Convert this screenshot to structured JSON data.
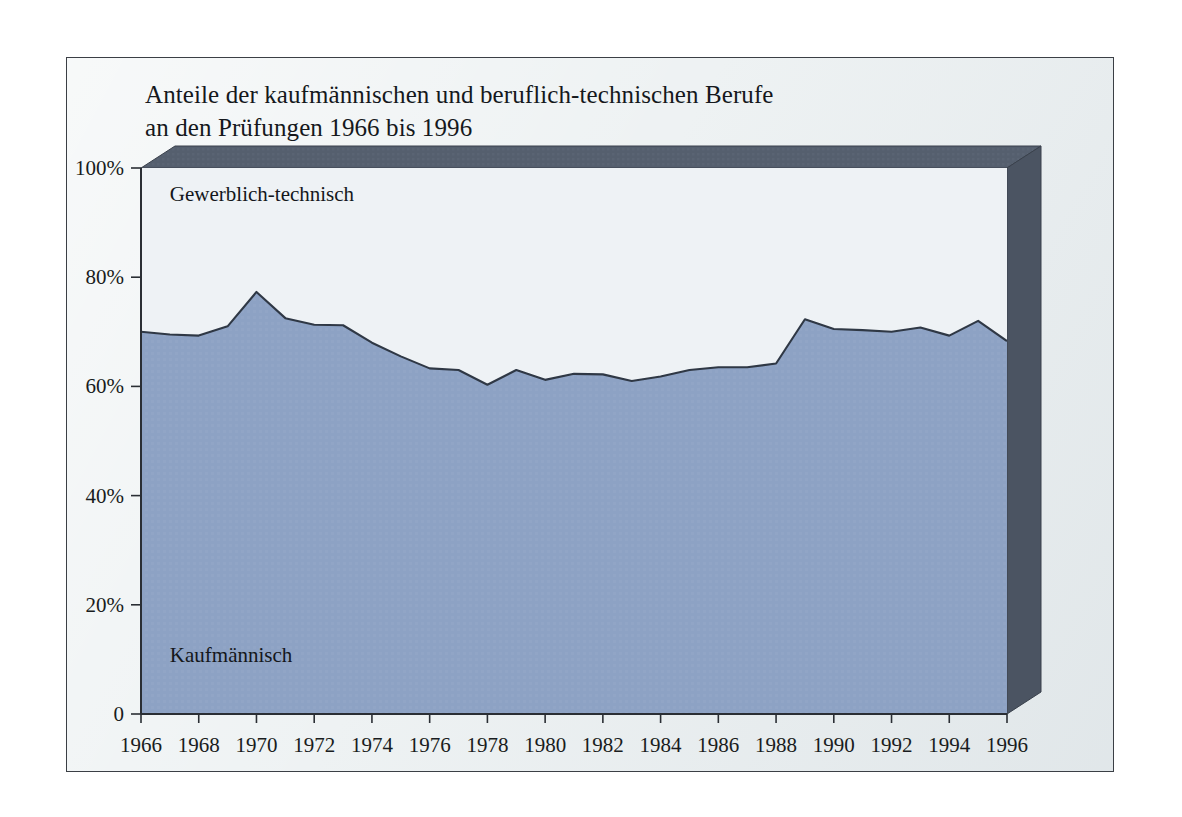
{
  "page": {
    "background_color": "#ffffff",
    "card_background_color": "#eef2f3",
    "card_border_color": "#3b3f45"
  },
  "title": {
    "line1": "Anteile der kaufmännischen und beruflich-technischen Berufe",
    "line2": "an den Prüfungen 1966 bis 1996"
  },
  "chart_data": {
    "type": "area",
    "title": "Anteile der kaufmännischen und beruflich-technischen Berufe an den Prüfungen 1966 bis 1996",
    "xlabel": "",
    "ylabel": "",
    "ylim": [
      0,
      100
    ],
    "xlim": [
      1966,
      1996
    ],
    "grid": false,
    "legend_position": "inline-annotation",
    "stacked": true,
    "y_tick_labels": [
      "0",
      "20%",
      "40%",
      "60%",
      "80%",
      "100%"
    ],
    "y_tick_values": [
      0,
      20,
      40,
      60,
      80,
      100
    ],
    "x_tick_labels": [
      "1966",
      "1968",
      "1970",
      "1972",
      "1974",
      "1976",
      "1978",
      "1980",
      "1982",
      "1984",
      "1986",
      "1988",
      "1990",
      "1992",
      "1994",
      "1996"
    ],
    "x_tick_values": [
      1966,
      1968,
      1970,
      1972,
      1974,
      1976,
      1978,
      1980,
      1982,
      1984,
      1986,
      1988,
      1990,
      1992,
      1994,
      1996
    ],
    "x": [
      1966,
      1967,
      1968,
      1969,
      1970,
      1971,
      1972,
      1973,
      1974,
      1975,
      1976,
      1977,
      1978,
      1979,
      1980,
      1981,
      1982,
      1983,
      1984,
      1985,
      1986,
      1987,
      1988,
      1989,
      1990,
      1991,
      1992,
      1993,
      1994,
      1995,
      1996
    ],
    "series": [
      {
        "name": "Kaufmännisch",
        "label": "Kaufmännisch",
        "color": "#8da2c4",
        "line_color": "#2f3845",
        "values": [
          70.0,
          69.5,
          69.3,
          71.0,
          77.3,
          72.5,
          71.3,
          71.2,
          68.0,
          65.5,
          63.3,
          63.0,
          60.3,
          63.0,
          61.2,
          62.3,
          62.2,
          61.0,
          61.8,
          63.0,
          63.5,
          63.5,
          64.2,
          72.3,
          70.5,
          70.3,
          70.0,
          70.8,
          69.3,
          72.0,
          68.3
        ]
      },
      {
        "name": "Gewerblich-technisch",
        "label": "Gewerblich-technisch",
        "color": "#eef2f5",
        "line_color": "#2f3845",
        "values": [
          30.0,
          30.5,
          30.7,
          29.0,
          22.7,
          27.5,
          28.7,
          28.8,
          32.0,
          34.5,
          36.7,
          37.0,
          39.7,
          37.0,
          38.8,
          37.7,
          37.8,
          39.0,
          38.2,
          37.0,
          36.5,
          36.5,
          35.8,
          27.7,
          29.5,
          29.7,
          30.0,
          29.2,
          30.7,
          28.0,
          31.7
        ]
      }
    ],
    "annotations": [
      {
        "text": "Gewerblich-technisch",
        "x": 1967.0,
        "y": 94.0
      },
      {
        "text": "Kaufmännisch",
        "x": 1967.0,
        "y": 9.5
      }
    ]
  },
  "style": {
    "plot_upper_fill": "#eef2f5",
    "plot_lower_fill": "#8da2c4",
    "axis_color": "#2a2e34",
    "bevel_color": "#555f6e",
    "bevel_side_color": "#4b5462"
  }
}
